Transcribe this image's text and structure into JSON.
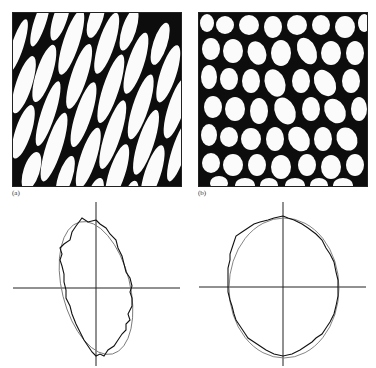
{
  "figure": {
    "panels": [
      {
        "id": "a",
        "label": "(a)",
        "type": "micrograph",
        "description": "elongated, aligned two-phase microstructure (white domains in black matrix, oriented diagonally)"
      },
      {
        "id": "b",
        "label": "(b)",
        "type": "micrograph",
        "description": "more isotropic, rounded two-phase microstructure (white domains in black matrix)"
      }
    ],
    "plots": [
      {
        "id": "a-rose",
        "under_panel": "a",
        "shape": "anisotropic elongated ellipse with jagged measured contour overlaid on fitted smooth ellipse",
        "axes": "cross-hair horizontal and vertical axes through center"
      },
      {
        "id": "b-rose",
        "under_panel": "b",
        "shape": "near-circular ellipse with jagged measured contour overlaid on fitted smooth ellipse",
        "axes": "cross-hair horizontal and vertical axes through center"
      }
    ]
  },
  "colors": {
    "ink": "#111111",
    "paper": "#ffffff",
    "fit_line": "#777777"
  }
}
